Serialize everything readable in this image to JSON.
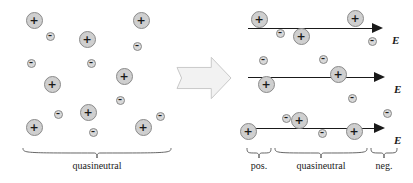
{
  "figure": {
    "colors": {
      "ion_fill": "#cfcfcf",
      "ion_stroke": "#8a8a8a",
      "electron_fill": "#d8d8d8",
      "line": "#1a1a1a",
      "chevron_fill": "#f2f2f2",
      "chevron_stroke": "#c9c9c9",
      "brace_stroke": "#555555"
    },
    "glyphs": {
      "positive": "+",
      "negative": "–"
    }
  },
  "left_panel": {
    "caption": "quasineutral",
    "brace": {
      "x0": 22,
      "x1": 172,
      "y": 148
    },
    "caption_pos": {
      "x": 22,
      "y": 160,
      "width": 150
    },
    "positive_ions": [
      {
        "x": 34,
        "y": 20
      },
      {
        "x": 87,
        "y": 39
      },
      {
        "x": 141,
        "y": 20
      },
      {
        "x": 124,
        "y": 76
      },
      {
        "x": 52,
        "y": 84
      },
      {
        "x": 88,
        "y": 112
      },
      {
        "x": 34,
        "y": 127
      },
      {
        "x": 143,
        "y": 127
      }
    ],
    "electrons": [
      {
        "x": 50,
        "y": 36
      },
      {
        "x": 137,
        "y": 46
      },
      {
        "x": 31,
        "y": 63
      },
      {
        "x": 91,
        "y": 63
      },
      {
        "x": 120,
        "y": 100
      },
      {
        "x": 58,
        "y": 114
      },
      {
        "x": 160,
        "y": 116
      },
      {
        "x": 93,
        "y": 132
      }
    ]
  },
  "chevron": {
    "name": "transition-arrow",
    "x": 176,
    "y": 56,
    "width": 56,
    "height": 44
  },
  "right_panel": {
    "rows": [
      {
        "field_label": "E",
        "line": {
          "x0": 248,
          "x1": 372,
          "y": 28
        },
        "label_pos": {
          "x": 392,
          "y": 34
        },
        "positive_ions": [
          {
            "x": 259,
            "y": 19
          },
          {
            "x": 355,
            "y": 18
          },
          {
            "x": 301,
            "y": 36
          }
        ],
        "electrons": [
          {
            "x": 280,
            "y": 33
          },
          {
            "x": 372,
            "y": 41
          }
        ]
      },
      {
        "field_label": "E",
        "line": {
          "x0": 248,
          "x1": 374,
          "y": 77
        },
        "label_pos": {
          "x": 394,
          "y": 83
        },
        "positive_ions": [
          {
            "x": 266,
            "y": 84
          },
          {
            "x": 338,
            "y": 74
          }
        ],
        "electrons": [
          {
            "x": 263,
            "y": 60
          },
          {
            "x": 323,
            "y": 59
          },
          {
            "x": 352,
            "y": 98
          }
        ]
      },
      {
        "field_label": "E",
        "line": {
          "x0": 248,
          "x1": 374,
          "y": 128
        },
        "label_pos": {
          "x": 394,
          "y": 134
        },
        "positive_ions": [
          {
            "x": 299,
            "y": 120
          },
          {
            "x": 248,
            "y": 131
          },
          {
            "x": 354,
            "y": 131
          }
        ],
        "electrons": [
          {
            "x": 286,
            "y": 118
          },
          {
            "x": 322,
            "y": 133
          },
          {
            "x": 387,
            "y": 113
          }
        ]
      }
    ],
    "braces": [
      {
        "label": "pos.",
        "x0": 246,
        "x1": 272,
        "y": 148,
        "cx": 259
      },
      {
        "label": "quasineutral",
        "x0": 274,
        "x1": 368,
        "y": 148,
        "cx": 321
      },
      {
        "label": "neg.",
        "x0": 370,
        "x1": 398,
        "y": 148,
        "cx": 384
      }
    ],
    "caption_y": 160
  }
}
